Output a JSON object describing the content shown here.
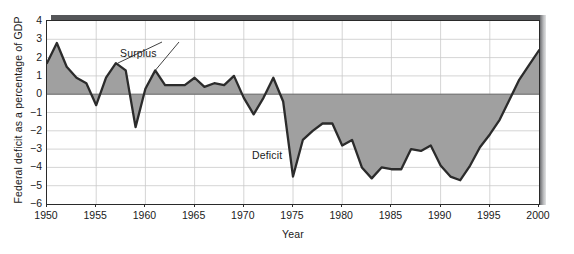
{
  "chart_data": {
    "type": "area",
    "title": "",
    "xlabel": "Year",
    "ylabel": "Federal deficit as a percentage of GDP",
    "xlim": [
      1950,
      2000
    ],
    "ylim": [
      -6,
      4
    ],
    "xticks": [
      1950,
      1955,
      1960,
      1965,
      1970,
      1975,
      1980,
      1985,
      1990,
      1995,
      2000
    ],
    "yticks": [
      4,
      3,
      2,
      1,
      0,
      -1,
      -2,
      -3,
      -4,
      -5,
      -6
    ],
    "grid": true,
    "legend": "none",
    "series_name": "Federal surplus/deficit",
    "baseline": 0,
    "annotations": [
      {
        "label": "Surplus",
        "x": 1959,
        "y": 2.2
      },
      {
        "label": "Deficit",
        "x": 1973,
        "y": -3.3
      }
    ],
    "x": [
      1950,
      1951,
      1952,
      1953,
      1954,
      1955,
      1956,
      1957,
      1958,
      1959,
      1960,
      1961,
      1962,
      1963,
      1964,
      1965,
      1966,
      1967,
      1968,
      1969,
      1970,
      1971,
      1972,
      1973,
      1974,
      1975,
      1976,
      1977,
      1978,
      1979,
      1980,
      1981,
      1982,
      1983,
      1984,
      1985,
      1986,
      1987,
      1988,
      1989,
      1990,
      1991,
      1992,
      1993,
      1994,
      1995,
      1996,
      1997,
      1998,
      1999,
      2000
    ],
    "values": [
      1.7,
      2.8,
      1.5,
      0.9,
      0.6,
      -0.6,
      0.9,
      1.7,
      1.3,
      -1.8,
      0.3,
      1.3,
      0.5,
      0.5,
      0.5,
      0.9,
      0.4,
      0.6,
      0.5,
      1.0,
      -0.2,
      -1.1,
      -0.2,
      0.9,
      -0.4,
      -4.5,
      -2.5,
      -2.0,
      -1.6,
      -1.6,
      -2.8,
      -2.5,
      -4.0,
      -4.6,
      -4.0,
      -4.1,
      -4.1,
      -3.0,
      -3.1,
      -2.8,
      -3.9,
      -4.5,
      -4.7,
      -3.9,
      -2.9,
      -2.2,
      -1.4,
      -0.3,
      0.8,
      1.6,
      2.4
    ]
  }
}
